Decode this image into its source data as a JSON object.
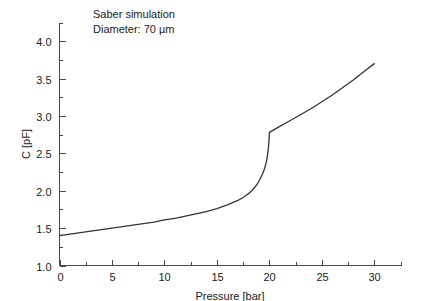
{
  "chart_data": {
    "type": "line",
    "title": "",
    "xlabel": "Pressure [bar]",
    "ylabel": "C [pF]",
    "xlim": [
      0,
      32.5
    ],
    "ylim": [
      1.0,
      4.25
    ],
    "grid": false,
    "legend": null,
    "x_ticks": [
      0,
      5,
      10,
      15,
      20,
      25,
      30
    ],
    "x_tick_labels": [
      "0",
      "5",
      "10",
      "15",
      "20",
      "25",
      "30"
    ],
    "x_minor_ticks": [
      2.5,
      7.5,
      12.5,
      17.5,
      22.5,
      27.5,
      32.5
    ],
    "y_ticks": [
      1.0,
      1.5,
      2.0,
      2.5,
      3.0,
      3.5,
      4.0
    ],
    "y_tick_labels": [
      "1.0",
      "1.5",
      "2.0",
      "2.5",
      "3.0",
      "3.5",
      "4.0"
    ],
    "y_minor_ticks": [
      1.25,
      1.75,
      2.25,
      2.75,
      3.25,
      3.75,
      4.25
    ],
    "annotations": [
      "Saber simulation",
      "Diameter: 70 µm"
    ],
    "series": [
      {
        "name": "C(p)",
        "color": "#333333",
        "x": [
          0,
          1,
          2,
          3,
          4,
          5,
          6,
          7,
          8,
          9,
          10,
          11,
          12,
          13,
          14,
          15,
          16,
          16.5,
          17,
          17.5,
          18,
          18.4,
          18.8,
          19.1,
          19.4,
          19.6,
          19.75,
          19.85,
          19.92,
          19.96,
          19.99,
          20.0,
          21,
          22,
          23,
          24,
          25,
          26,
          27,
          28,
          29,
          30
        ],
        "values": [
          1.4,
          1.42,
          1.44,
          1.46,
          1.48,
          1.5,
          1.52,
          1.54,
          1.56,
          1.58,
          1.61,
          1.63,
          1.66,
          1.69,
          1.72,
          1.76,
          1.81,
          1.84,
          1.87,
          1.91,
          1.96,
          2.01,
          2.08,
          2.15,
          2.24,
          2.32,
          2.41,
          2.5,
          2.59,
          2.66,
          2.74,
          2.78,
          2.86,
          2.94,
          3.02,
          3.1,
          3.19,
          3.28,
          3.38,
          3.48,
          3.59,
          3.7
        ]
      }
    ]
  },
  "axes": {
    "x_axis_name": "pressure-axis",
    "y_axis_name": "capacitance-axis"
  }
}
